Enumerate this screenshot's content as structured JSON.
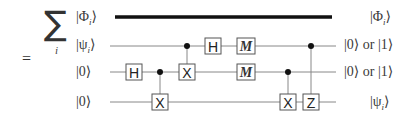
{
  "diagram": {
    "type": "quantum-circuit",
    "equals_sign": "=",
    "sum_symbol": "∑",
    "sum_index": "i",
    "input_labels": [
      {
        "text": "|Φ",
        "sub": "i",
        "close": "⟩"
      },
      {
        "text": "|ψ",
        "sub": "i",
        "close": "⟩"
      },
      {
        "text": "|0",
        "sub": "",
        "close": "⟩"
      },
      {
        "text": "|0",
        "sub": "",
        "close": "⟩"
      }
    ],
    "output_labels": [
      {
        "text": "|Φ",
        "sub": "i",
        "close": "⟩"
      },
      {
        "text": "|0⟩ or |1⟩",
        "sub": "",
        "close": ""
      },
      {
        "text": "|0⟩ or |1⟩",
        "sub": "",
        "close": ""
      },
      {
        "text": "|ψ",
        "sub": "i",
        "close": "⟩"
      }
    ],
    "gates": {
      "h1": "H",
      "cx1": "X",
      "cx2": "X",
      "h2": "H",
      "m1": "M",
      "m2": "M",
      "cx3": "X",
      "cz": "Z"
    },
    "colors": {
      "wire": "#888888",
      "thick_wire": "#111111",
      "gate_border": "#555555",
      "control_dot": "#111111"
    }
  }
}
